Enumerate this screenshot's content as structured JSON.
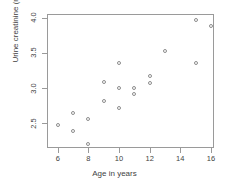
{
  "chart_data": {
    "type": "scatter",
    "title": "",
    "xlabel": "Age in years",
    "ylabel": "Urine creatinine (mmol)",
    "xlim": [
      5.3,
      16.2
    ],
    "ylim": [
      2.15,
      4.05
    ],
    "xticks": [
      6,
      8,
      10,
      12,
      14,
      16
    ],
    "xtick_labels": [
      "6",
      "8",
      "10",
      "12",
      "14",
      "16"
    ],
    "yticks": [
      2.5,
      3.0,
      3.5,
      4.0
    ],
    "ytick_labels": [
      "2.5",
      "3.0",
      "3.5",
      "4.0"
    ],
    "grid": false,
    "legend": null,
    "marker": "open-circle",
    "marker_color": "#8d8d8d",
    "frame_color": "#9a9a9a",
    "points": [
      {
        "x": 6.0,
        "y": 2.48
      },
      {
        "x": 7.0,
        "y": 2.64
      },
      {
        "x": 7.0,
        "y": 2.39
      },
      {
        "x": 8.0,
        "y": 2.56
      },
      {
        "x": 8.0,
        "y": 2.21
      },
      {
        "x": 9.0,
        "y": 3.08
      },
      {
        "x": 9.0,
        "y": 2.82
      },
      {
        "x": 10.0,
        "y": 3.35
      },
      {
        "x": 10.0,
        "y": 3.0
      },
      {
        "x": 10.0,
        "y": 2.72
      },
      {
        "x": 11.0,
        "y": 3.0
      },
      {
        "x": 11.0,
        "y": 2.91
      },
      {
        "x": 12.0,
        "y": 3.17
      },
      {
        "x": 12.0,
        "y": 3.07
      },
      {
        "x": 13.0,
        "y": 3.53
      },
      {
        "x": 15.0,
        "y": 3.97
      },
      {
        "x": 15.0,
        "y": 3.35
      },
      {
        "x": 16.0,
        "y": 3.88
      }
    ]
  }
}
